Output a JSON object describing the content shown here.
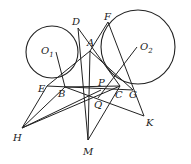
{
  "diagram": {
    "type": "geometry",
    "circles": [
      {
        "name": "O1",
        "cx": 52,
        "cy": 52,
        "r": 26
      },
      {
        "name": "O2",
        "cx": 138,
        "cy": 47,
        "r": 37
      }
    ],
    "points": {
      "D": [
        78,
        28
      ],
      "F": [
        108,
        22
      ],
      "A": [
        90,
        51
      ],
      "E": [
        47,
        86
      ],
      "B": [
        65,
        87
      ],
      "P": [
        101,
        90
      ],
      "Q": [
        98,
        98
      ],
      "C": [
        120,
        86
      ],
      "G": [
        133,
        90
      ],
      "H": [
        22,
        128
      ],
      "M": [
        88,
        140
      ],
      "K": [
        144,
        116
      ],
      "O1": [
        56,
        52
      ],
      "O2": [
        137,
        47
      ]
    },
    "segments": [
      [
        "D",
        "M"
      ],
      [
        "F",
        "K"
      ],
      [
        "E",
        "A"
      ],
      [
        "A",
        "G"
      ],
      [
        "D",
        "C"
      ],
      [
        "H",
        "E"
      ],
      [
        "H",
        "B"
      ],
      [
        "H",
        "C"
      ],
      [
        "H",
        "P"
      ],
      [
        "B",
        "K"
      ],
      [
        "B",
        "C"
      ],
      [
        "E",
        "G"
      ],
      [
        "M",
        "A"
      ],
      [
        "M",
        "C"
      ],
      [
        "O2",
        "Q"
      ],
      [
        "F",
        "A"
      ],
      [
        "O1",
        "B"
      ]
    ],
    "labels": [
      {
        "id": "D",
        "text": "D",
        "x": 72,
        "y": 17
      },
      {
        "id": "F",
        "text": "F",
        "x": 104,
        "y": 12
      },
      {
        "id": "A",
        "text": "A",
        "x": 87,
        "y": 38
      },
      {
        "id": "O1",
        "text": "O",
        "sub": "1",
        "x": 41,
        "y": 46
      },
      {
        "id": "O2",
        "text": "O",
        "sub": "2",
        "x": 140,
        "y": 42
      },
      {
        "id": "E",
        "text": "E",
        "x": 38,
        "y": 84
      },
      {
        "id": "B",
        "text": "B",
        "x": 58,
        "y": 89
      },
      {
        "id": "P",
        "text": "P",
        "x": 98,
        "y": 78
      },
      {
        "id": "Q",
        "text": "Q",
        "x": 94,
        "y": 100
      },
      {
        "id": "C",
        "text": "C",
        "x": 115,
        "y": 90
      },
      {
        "id": "G",
        "text": "G",
        "x": 129,
        "y": 90
      },
      {
        "id": "H",
        "text": "H",
        "x": 13,
        "y": 133
      },
      {
        "id": "M",
        "text": "M",
        "x": 83,
        "y": 147
      },
      {
        "id": "K",
        "text": "K",
        "x": 146,
        "y": 118
      }
    ]
  }
}
